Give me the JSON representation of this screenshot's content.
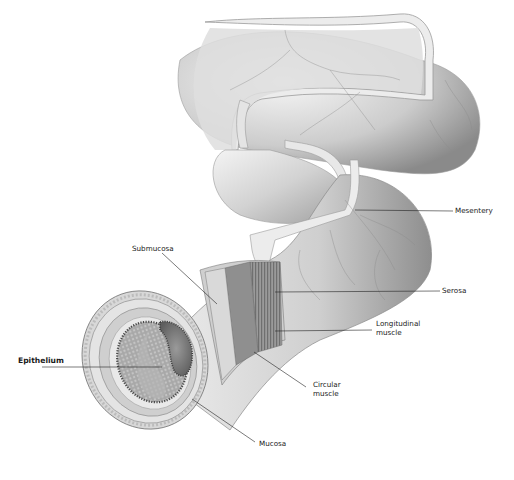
{
  "diagram": {
    "colors": {
      "background": "#ffffff",
      "tissue_light": "#e6e6e6",
      "tissue_mid": "#bdbdbd",
      "tissue_dark": "#8a8a8a",
      "lumen_dark": "#6b6b6b",
      "leader_line": "#222222",
      "label_text": "#1a1a1a"
    },
    "labels": [
      {
        "id": "mesentery",
        "text": "Mesentery",
        "x": 455,
        "y": 208
      },
      {
        "id": "submucosa",
        "text": "Submucosa",
        "x": 132,
        "y": 245
      },
      {
        "id": "serosa",
        "text": "Serosa",
        "x": 442,
        "y": 288
      },
      {
        "id": "longitudinal_muscle",
        "lines": [
          "Longitudinal",
          "muscle"
        ],
        "x": 376,
        "y": 320
      },
      {
        "id": "epithelium",
        "text": "Epithelium",
        "x": 18,
        "y": 357
      },
      {
        "id": "circular_muscle",
        "lines": [
          "Circular",
          "muscle"
        ],
        "x": 313,
        "y": 380
      },
      {
        "id": "mucosa",
        "text": "Mucosa",
        "x": 259,
        "y": 440
      }
    ]
  }
}
